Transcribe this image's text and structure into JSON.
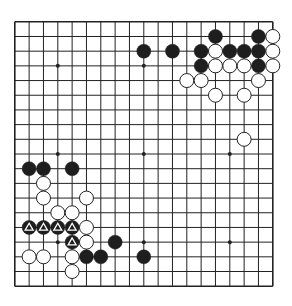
{
  "diagram": {
    "type": "go-board",
    "size": 19,
    "colors": {
      "background": "#ffffff",
      "line": "#222222",
      "black_stone": "#1e1e1e",
      "white_stone": "#ffffff",
      "stone_outline": "#222222",
      "mark": "#ffffff"
    },
    "star_points": [
      [
        3,
        3
      ],
      [
        9,
        3
      ],
      [
        15,
        3
      ],
      [
        3,
        9
      ],
      [
        9,
        9
      ],
      [
        15,
        9
      ],
      [
        3,
        15
      ],
      [
        9,
        15
      ],
      [
        15,
        15
      ]
    ],
    "black_stones": [
      {
        "col": 14,
        "row": 1
      },
      {
        "col": 17,
        "row": 1
      },
      {
        "col": 9,
        "row": 2
      },
      {
        "col": 11,
        "row": 2
      },
      {
        "col": 13,
        "row": 2
      },
      {
        "col": 15,
        "row": 2
      },
      {
        "col": 16,
        "row": 2
      },
      {
        "col": 17,
        "row": 2
      },
      {
        "col": 13,
        "row": 3
      },
      {
        "col": 17,
        "row": 3
      },
      {
        "col": 1,
        "row": 10
      },
      {
        "col": 2,
        "row": 10
      },
      {
        "col": 4,
        "row": 10
      },
      {
        "col": 1,
        "row": 14,
        "mark": "triangle"
      },
      {
        "col": 2,
        "row": 14,
        "mark": "triangle"
      },
      {
        "col": 3,
        "row": 14,
        "mark": "triangle"
      },
      {
        "col": 4,
        "row": 14,
        "mark": "triangle"
      },
      {
        "col": 4,
        "row": 15,
        "mark": "triangle"
      },
      {
        "col": 7,
        "row": 15
      },
      {
        "col": 5,
        "row": 16
      },
      {
        "col": 6,
        "row": 16
      },
      {
        "col": 9,
        "row": 16
      }
    ],
    "white_stones": [
      {
        "col": 18,
        "row": 1
      },
      {
        "col": 14,
        "row": 2
      },
      {
        "col": 18,
        "row": 2
      },
      {
        "col": 14,
        "row": 3
      },
      {
        "col": 15,
        "row": 3
      },
      {
        "col": 16,
        "row": 3
      },
      {
        "col": 18,
        "row": 3
      },
      {
        "col": 12,
        "row": 4
      },
      {
        "col": 13,
        "row": 4
      },
      {
        "col": 17,
        "row": 4
      },
      {
        "col": 14,
        "row": 5
      },
      {
        "col": 16,
        "row": 5
      },
      {
        "col": 16,
        "row": 8
      },
      {
        "col": 2,
        "row": 11
      },
      {
        "col": 2,
        "row": 12
      },
      {
        "col": 5,
        "row": 12
      },
      {
        "col": 3,
        "row": 13
      },
      {
        "col": 4,
        "row": 13
      },
      {
        "col": 5,
        "row": 14
      },
      {
        "col": 5,
        "row": 15
      },
      {
        "col": 1,
        "row": 16
      },
      {
        "col": 2,
        "row": 16
      },
      {
        "col": 4,
        "row": 16
      },
      {
        "col": 4,
        "row": 17
      }
    ]
  }
}
